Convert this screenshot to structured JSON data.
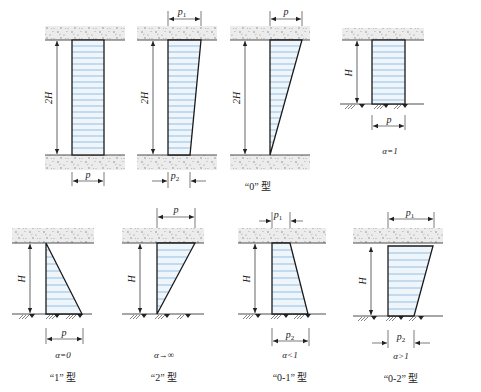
{
  "colors": {
    "stroke": "#1a1a1a",
    "fill": "#eef6fc",
    "hatch": "#6fa8d6",
    "soil": "#e6e6e6",
    "soil_dots": "#7a7a7a"
  },
  "group_top": {
    "caption": "“0” 型",
    "figures": [
      {
        "id": "uniform-2H",
        "height_label": "2H",
        "top_label": "",
        "bottom_label": "p",
        "shape": "rectangle"
      },
      {
        "id": "trapezoid-2H",
        "height_label": "2H",
        "top_label": "p1",
        "bottom_label": "p2",
        "shape": "trapezoid-narrowing"
      },
      {
        "id": "triangle-2H",
        "height_label": "2H",
        "top_label": "p",
        "bottom_label": "",
        "shape": "triangle-inverted"
      },
      {
        "id": "uniform-H",
        "height_label": "H",
        "top_label": "",
        "bottom_label": "p",
        "shape": "rectangle",
        "alpha": "α=1"
      }
    ]
  },
  "group_bottom": {
    "figures": [
      {
        "id": "type-1",
        "height_label": "H",
        "bottom_label": "p",
        "alpha": "α=0",
        "caption": "“1” 型"
      },
      {
        "id": "type-2",
        "height_label": "H",
        "top_label": "p",
        "alpha": "α→∞",
        "caption": "“2” 型"
      },
      {
        "id": "type-0-1",
        "height_label": "H",
        "top_label": "p1",
        "bottom_label": "p2",
        "alpha": "α<1",
        "caption": "“0-1” 型"
      },
      {
        "id": "type-0-2",
        "height_label": "H",
        "top_label": "p1",
        "bottom_label": "p2",
        "alpha": "α>1",
        "caption": "“0-2” 型"
      }
    ]
  },
  "labels": {
    "twoH": "2H",
    "H": "H",
    "p": "p",
    "p1": "p",
    "p1_sub": "1",
    "p2": "p",
    "p2_sub": "2"
  }
}
